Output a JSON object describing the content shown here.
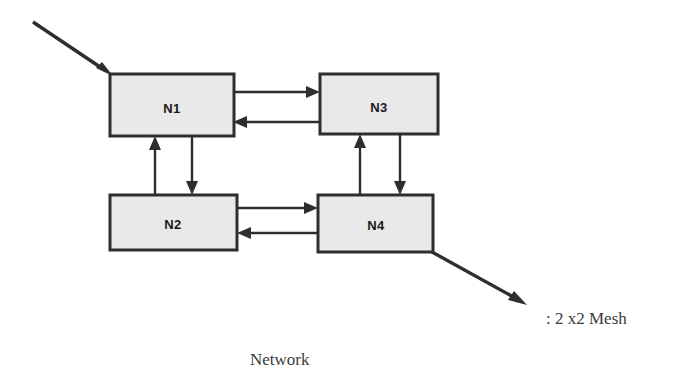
{
  "figure": {
    "kind": "network-topology-diagram",
    "background_color": "#ffffff",
    "node_fill_color": "#e9e9e9",
    "node_stroke_color": "#2e2e2e",
    "caption_color": "#3a3a3a"
  },
  "nodes": [
    {
      "id": "n1",
      "label": "N1",
      "x": 110,
      "y": 74,
      "w": 124,
      "h": 62
    },
    {
      "id": "n3",
      "label": "N3",
      "x": 320,
      "y": 74,
      "w": 118,
      "h": 60
    },
    {
      "id": "n2",
      "label": "N2",
      "x": 110,
      "y": 195,
      "w": 127,
      "h": 55
    },
    {
      "id": "n4",
      "label": "N4",
      "x": 318,
      "y": 195,
      "w": 115,
      "h": 57
    }
  ],
  "links": [
    {
      "id": "n1-to-n3",
      "from": "N1",
      "to": "N3",
      "direction": "right"
    },
    {
      "id": "n3-to-n1",
      "from": "N3",
      "to": "N1",
      "direction": "left"
    },
    {
      "id": "n2-to-n1",
      "from": "N2",
      "to": "N1",
      "direction": "up"
    },
    {
      "id": "n1-to-n2",
      "from": "N1",
      "to": "N2",
      "direction": "down"
    },
    {
      "id": "n4-to-n3",
      "from": "N4",
      "to": "N3",
      "direction": "up"
    },
    {
      "id": "n3-to-n4",
      "from": "N3",
      "to": "N4",
      "direction": "down"
    },
    {
      "id": "n2-to-n4",
      "from": "N2",
      "to": "N4",
      "direction": "right"
    },
    {
      "id": "n4-to-n2",
      "from": "N4",
      "to": "N2",
      "direction": "left"
    }
  ],
  "external_links": [
    {
      "id": "network-input",
      "target": "N1",
      "direction": "inbound"
    },
    {
      "id": "network-output",
      "source": "N4",
      "direction": "outbound"
    }
  ],
  "captions": {
    "mesh_label": ": 2 x2 Mesh",
    "network_label": "Network"
  }
}
